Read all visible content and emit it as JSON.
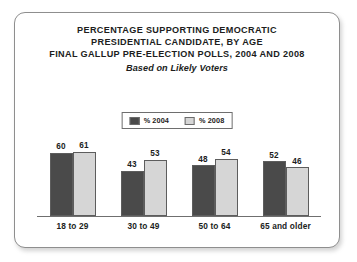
{
  "chart_data": {
    "type": "bar",
    "title_lines": [
      "PERCENTAGE SUPPORTING DEMOCRATIC",
      "PRESIDENTIAL CANDIDATE, BY AGE",
      "FINAL GALLUP PRE-ELECTION POLLS, 2004 AND 2008"
    ],
    "subtitle": "Based on Likely Voters",
    "categories": [
      "18 to 29",
      "30 to 49",
      "50 to 64",
      "65 and older"
    ],
    "series": [
      {
        "name": "% 2004",
        "values": [
          60,
          43,
          48,
          52
        ],
        "color": "#4a4a4a"
      },
      {
        "name": "% 2008",
        "values": [
          61,
          53,
          54,
          46
        ],
        "color": "#d6d6d6"
      }
    ],
    "xlabel": "",
    "ylabel": "",
    "ylim": [
      0,
      75
    ],
    "grid": false,
    "legend_position": "top-center",
    "value_labels": true
  },
  "card": {
    "border_color": "#8e8e8e",
    "background": "#ffffff"
  }
}
